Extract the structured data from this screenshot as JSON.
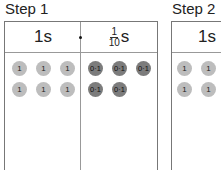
{
  "steps": [
    {
      "title": "Step 1",
      "columns": [
        {
          "header": "1s",
          "counter_label": "1",
          "count": 6,
          "counter_color": "#bdbdbd"
        },
        {
          "header_numerator": "1",
          "header_denominator": "10",
          "header_unit": "s",
          "counter_label": "0·1",
          "count": 5,
          "counter_color": "#7c7c7c"
        }
      ],
      "decimal_point": "•"
    },
    {
      "title": "Step 2",
      "columns": [
        {
          "header": "1s",
          "counter_label": "1",
          "count": 4,
          "counter_color": "#bdbdbd"
        }
      ]
    }
  ]
}
